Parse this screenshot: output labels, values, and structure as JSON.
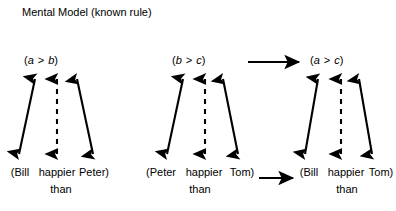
{
  "figure": {
    "title": "Mental Model (known rule)",
    "background_color": "#ffffff",
    "stroke_color": "#000000"
  },
  "panels": [
    {
      "id": "premise-1",
      "abstract": {
        "open": "(",
        "left": "a",
        "operator": ">",
        "right": "b",
        "close": ")"
      },
      "sentence": {
        "open_subject": "(Bill",
        "relation": "happier",
        "object_close": "Peter)",
        "connector": "than"
      }
    },
    {
      "id": "premise-2",
      "abstract": {
        "open": "(",
        "left": "b",
        "operator": ">",
        "right": "c",
        "close": ")"
      },
      "sentence": {
        "open_subject": "(Peter",
        "relation": "happier",
        "object_close": "Tom)",
        "connector": "than"
      }
    },
    {
      "id": "conclusion",
      "abstract": {
        "open": "(",
        "left": "a",
        "operator": ">",
        "right": "c",
        "close": ")"
      },
      "sentence": {
        "open_subject": "(Bill",
        "relation": "happier",
        "object_close": "Tom)",
        "connector": "than"
      }
    }
  ],
  "connectors": {
    "abstract_inference_arrow": "horizontal-arrow-right",
    "concrete_inference_arrow": "horizontal-arrow-right",
    "mapping_arrow_solid": "double-headed-solid-arrow",
    "mapping_arrow_dashed": "double-headed-dashed-arrow"
  }
}
